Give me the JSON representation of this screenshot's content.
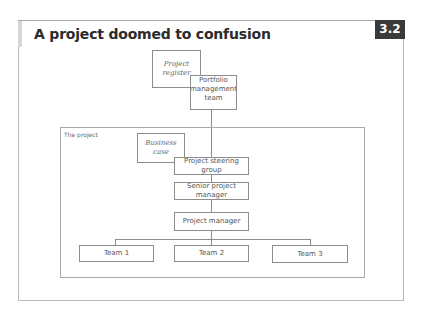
{
  "header": {
    "title": "A project doomed to confusion",
    "figure_number": "3.2"
  },
  "diagram": {
    "project_boundary_label": "The project",
    "documents": {
      "project_register": "Project\nregister",
      "business_case": "Business\ncase"
    },
    "nodes": {
      "portfolio_management_team": "Portfolio\nmanagement\nteam",
      "project_steering_group": "Project steering group",
      "senior_project_manager": "Senior project manager",
      "project_manager": "Project manager"
    },
    "teams": [
      "Team 1",
      "Team 2",
      "Team 3"
    ]
  }
}
